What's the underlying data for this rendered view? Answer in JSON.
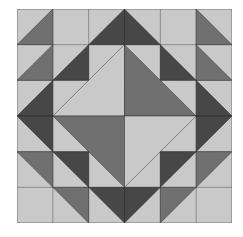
{
  "colors": {
    "light": "#c9c9c9",
    "medium": "#707070",
    "dark": "#474747",
    "outline": "#1e1e1e"
  },
  "grid": {
    "cols": 6,
    "rows": 6
  },
  "background": {
    "fill": "light"
  },
  "pieces": [
    {
      "tone": "medium",
      "points": "1,0 1,1 0,1"
    },
    {
      "tone": "dark",
      "points": "3,0 3,1 2,1"
    },
    {
      "tone": "dark",
      "points": "3,0 4,1 3,1"
    },
    {
      "tone": "medium",
      "points": "5,0 6,1 5,1"
    },
    {
      "tone": "medium",
      "points": "1,1 1,2 0,2"
    },
    {
      "tone": "dark",
      "points": "2,1 2,2 1,2"
    },
    {
      "tone": "dark",
      "points": "4,1 5,2 4,2"
    },
    {
      "tone": "medium",
      "points": "5,1 6,2 5,2"
    },
    {
      "tone": "dark",
      "points": "1,2 1,3 0,3"
    },
    {
      "tone": "dark",
      "points": "0,3 1,3 1,4"
    },
    {
      "tone": "dark",
      "points": "5,2 6,3 5,3"
    },
    {
      "tone": "dark",
      "points": "5,3 6,3 5,4"
    },
    {
      "tone": "light",
      "points": "3,1 3,3 1,3"
    },
    {
      "tone": "medium",
      "points": "3,1 5,3 3,3"
    },
    {
      "tone": "medium",
      "points": "1,3 3,3 3,5"
    },
    {
      "tone": "light",
      "points": "3,3 5,3 3,5"
    },
    {
      "tone": "medium",
      "points": "0,4 1,4 1,5"
    },
    {
      "tone": "dark",
      "points": "1,4 2,4 2,5"
    },
    {
      "tone": "dark",
      "points": "4,4 5,4 4,5"
    },
    {
      "tone": "medium",
      "points": "5,4 6,4 5,5"
    },
    {
      "tone": "medium",
      "points": "1,5 2,5 2,6"
    },
    {
      "tone": "dark",
      "points": "2,5 3,5 3,6"
    },
    {
      "tone": "dark",
      "points": "3,5 4,5 3,6"
    },
    {
      "tone": "medium",
      "points": "4,5 5,5 4,6"
    }
  ],
  "lines": [
    "0,1 6,1",
    "0,2 6,2",
    "0,4 6,4",
    "0,5 6,5",
    "1,0 1,6",
    "2,0 2,6",
    "4,0 4,6",
    "5,0 5,6",
    "3,0 3,6",
    "0,3 6,3"
  ]
}
